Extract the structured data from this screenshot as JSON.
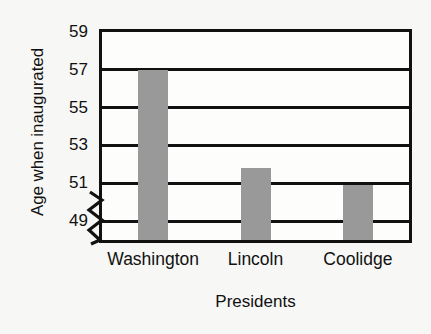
{
  "chart_data": {
    "type": "bar",
    "title": "",
    "xlabel": "Presidents",
    "ylabel": "Age when inaugurated",
    "categories": [
      "Washington",
      "Lincoln",
      "Coolidge"
    ],
    "values": [
      57,
      51.8,
      50.9
    ],
    "ylim": [
      48,
      59
    ],
    "yticks": [
      59,
      57,
      55,
      53,
      51,
      49
    ],
    "ytick_labels": [
      "59",
      "57",
      "55",
      "53",
      "51",
      "49"
    ],
    "grid": true,
    "grid_orientation": "horizontal",
    "legend": "none",
    "axis_break": true,
    "axis_break_note": "zigzag break on y-axis below 49",
    "bar_color": "#999999",
    "axis_color": "#111111",
    "background_color": "#f7f7f5"
  },
  "axis": {
    "y_title": "Age when inaugurated",
    "x_title": "Presidents"
  }
}
